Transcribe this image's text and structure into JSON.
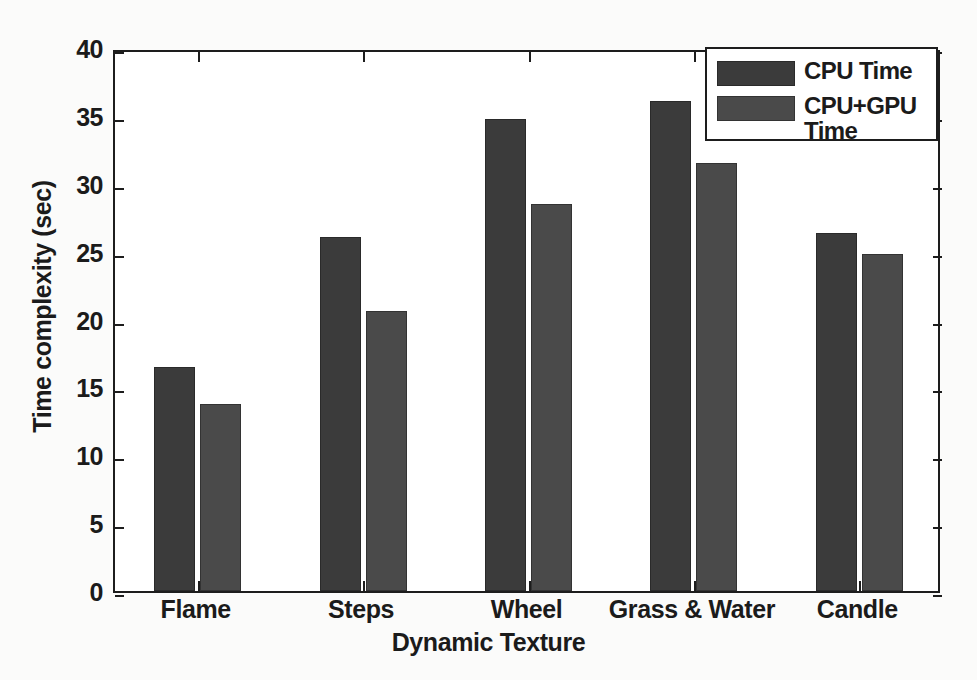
{
  "chart_data": {
    "type": "bar",
    "title": "",
    "xlabel": "Dynamic Texture",
    "ylabel": "Time complexity (sec)",
    "categories": [
      "Flame",
      "Steps",
      "Wheel",
      "Grass & Water",
      "Candle"
    ],
    "series": [
      {
        "name": "CPU Time",
        "values": [
          16.5,
          26.1,
          34.8,
          36.1,
          26.4
        ],
        "color": "#3b3b3b"
      },
      {
        "name": "CPU+GPU Time",
        "values": [
          13.8,
          20.6,
          28.5,
          31.5,
          24.8
        ],
        "color": "#4a4a4a"
      }
    ],
    "ylim": [
      0,
      40
    ],
    "yticks": [
      0,
      5,
      10,
      15,
      20,
      25,
      30,
      35,
      40
    ],
    "ytick_labels": [
      "0",
      "5",
      "10",
      "15",
      "20",
      "25",
      "30",
      "35",
      "40"
    ],
    "grid": false,
    "legend_position": "top-right",
    "legend_entries": [
      "CPU Time",
      "CPU+GPU\nTime"
    ]
  },
  "legend": {
    "entries": [
      {
        "label": "CPU Time",
        "series": "cpu"
      },
      {
        "label": "CPU+GPU\nTime",
        "series": "cpugpu"
      }
    ]
  },
  "axes": {
    "x_title": "Dynamic Texture",
    "y_title": "Time complexity (sec)"
  }
}
